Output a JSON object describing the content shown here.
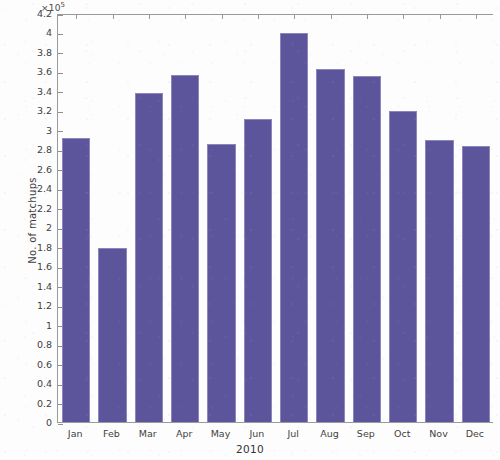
{
  "chart_data": {
    "type": "bar",
    "title": "",
    "xlabel": "2010",
    "ylabel": "No. of matchups",
    "y_multiplier": "×10",
    "y_exponent": "5",
    "exponent_text": "·10⁵",
    "categories": [
      "Jan",
      "Feb",
      "Mar",
      "Apr",
      "May",
      "Jun",
      "Jul",
      "Aug",
      "Sep",
      "Oct",
      "Nov",
      "Dec"
    ],
    "values": [
      2.92,
      1.79,
      3.38,
      3.56,
      2.85,
      3.11,
      3.99,
      3.63,
      3.55,
      3.19,
      2.9,
      2.83
    ],
    "ylim": [
      0,
      4.2
    ],
    "y_ticks": [
      "0",
      "0.2",
      "0.4",
      "0.6",
      "0.8",
      "1",
      "1.2",
      "1.4",
      "1.6",
      "1.8",
      "2",
      "2.2",
      "2.4",
      "2.6",
      "2.8",
      "3",
      "3.2",
      "3.4",
      "3.6",
      "3.8",
      "4",
      "4.2"
    ],
    "y_tick_values": [
      0,
      0.2,
      0.4,
      0.6,
      0.8,
      1,
      1.2,
      1.4,
      1.6,
      1.8,
      2,
      2.2,
      2.4,
      2.6,
      2.8,
      3,
      3.2,
      3.4,
      3.6,
      3.8,
      4,
      4.2
    ],
    "grid": false,
    "legend": null,
    "bar_color": "#5d559b",
    "bar_edge_color": "#8d86bd",
    "axis_color": "#9a9a9a",
    "background_color": "#fdfdfd"
  }
}
